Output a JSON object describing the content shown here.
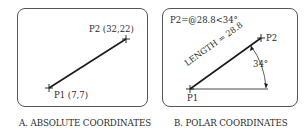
{
  "panels": {
    "absolute": {
      "caption": "A. ABSOLUTE COORDINATES",
      "p1_label": "P1 (7,7)",
      "p2_label": "P2 (32,22)"
    },
    "polar": {
      "caption": "B. POLAR COORDINATES",
      "formula": "P2=@28.8<34°",
      "length_label": "LENGTH = 28.8",
      "angle_label": "34°",
      "p1_label": "P1",
      "p2_label": "P2"
    }
  },
  "colors": {
    "line": "#1a1a1a",
    "border": "#555555",
    "text": "#2a2a2a"
  }
}
